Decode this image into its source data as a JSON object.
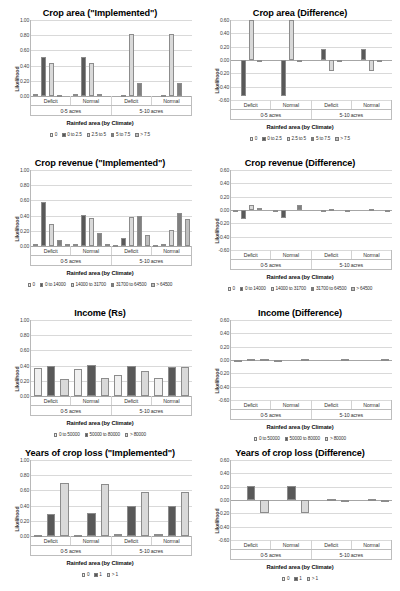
{
  "figure": {
    "axis_title_x": "Rainfed area (by Climate)",
    "axis_title_y": "Likelihood",
    "group_labels": [
      "Deficit",
      "Normal",
      "Deficit",
      "Normal"
    ],
    "band_labels": [
      "0-5 acres",
      "5-10 acres"
    ]
  },
  "palette": {
    "s1": "#f0f0f0",
    "s2": "#595959",
    "s3": "#d9d9d9",
    "s4": "#808080",
    "s5": "#bfbfbf"
  },
  "charts": [
    {
      "id": "crop-area-implemented",
      "title": "Crop area (\"Implemented\")",
      "yticks": [
        "1.00",
        "0.80",
        "0.60",
        "0.40",
        "0.20",
        "0.00"
      ],
      "chart_data": {
        "type": "bar",
        "title": "Crop area (\"Implemented\")",
        "xlabel": "Rainfed area (by Climate)",
        "ylabel": "Likelihood",
        "ylim": [
          0.0,
          1.0
        ],
        "grid": true,
        "legend_position": "bottom",
        "categories": [
          "Deficit (0-5 acres)",
          "Normal (0-5 acres)",
          "Deficit (5-10 acres)",
          "Normal (5-10 acres)"
        ],
        "series": [
          {
            "name": "0",
            "values": [
              0.02,
              0.02,
              0.0,
              0.0
            ]
          },
          {
            "name": "0 to 2.5",
            "values": [
              0.51,
              0.51,
              0.01,
              0.01
            ]
          },
          {
            "name": "2.5 to 5",
            "values": [
              0.43,
              0.43,
              0.82,
              0.82
            ]
          },
          {
            "name": "5 to 7.5",
            "values": [
              0.01,
              0.02,
              0.17,
              0.17
            ]
          },
          {
            "name": "> 7.5",
            "values": [
              0.0,
              0.0,
              0.0,
              0.0
            ]
          }
        ]
      }
    },
    {
      "id": "crop-area-difference",
      "title": "Crop area (Difference)",
      "yticks": [
        "0.60",
        "0.40",
        "0.20",
        "0.00",
        "-0.20",
        "-0.40",
        "-0.60"
      ],
      "chart_data": {
        "type": "bar",
        "title": "Crop area (Difference)",
        "xlabel": "Rainfed area (by Climate)",
        "ylabel": "Likelihood",
        "ylim": [
          -0.6,
          0.6
        ],
        "grid": true,
        "legend_position": "bottom",
        "categories": [
          "Deficit (0-5 acres)",
          "Normal (0-5 acres)",
          "Deficit (5-10 acres)",
          "Normal (5-10 acres)"
        ],
        "series": [
          {
            "name": "0",
            "values": [
              0.0,
              0.0,
              0.0,
              0.0
            ]
          },
          {
            "name": "0 to 2.5",
            "values": [
              -0.54,
              -0.54,
              0.17,
              0.17
            ]
          },
          {
            "name": "2.5 to 5",
            "values": [
              0.6,
              0.6,
              -0.16,
              -0.16
            ]
          },
          {
            "name": "5 to 7.5",
            "values": [
              -0.01,
              -0.01,
              -0.01,
              -0.01
            ]
          },
          {
            "name": "> 7.5",
            "values": [
              0.0,
              0.0,
              0.0,
              0.0
            ]
          }
        ]
      }
    },
    {
      "id": "crop-revenue-implemented",
      "title": "Crop revenue (\"Implemented\")",
      "yticks": [
        "1.00",
        "0.80",
        "0.60",
        "0.40",
        "0.20",
        "0.00"
      ],
      "chart_data": {
        "type": "bar",
        "title": "Crop revenue (\"Implemented\")",
        "xlabel": "Rainfed area (by Climate)",
        "ylabel": "Likelihood",
        "ylim": [
          0.0,
          1.0
        ],
        "grid": true,
        "legend_position": "bottom",
        "categories": [
          "Deficit (0-5 acres)",
          "Normal (0-5 acres)",
          "Deficit (5-10 acres)",
          "Normal (5-10 acres)"
        ],
        "series": [
          {
            "name": "0",
            "values": [
              0.02,
              0.03,
              0.01,
              0.01
            ]
          },
          {
            "name": "0 to 14000",
            "values": [
              0.58,
              0.41,
              0.1,
              0.03
            ]
          },
          {
            "name": "14000 to 31700",
            "values": [
              0.29,
              0.37,
              0.38,
              0.21
            ]
          },
          {
            "name": "31700 to 64500",
            "values": [
              0.08,
              0.17,
              0.39,
              0.43
            ]
          },
          {
            "name": "> 64500",
            "values": [
              0.02,
              0.03,
              0.15,
              0.36
            ]
          }
        ]
      }
    },
    {
      "id": "crop-revenue-difference",
      "title": "Crop revenue (Difference)",
      "yticks": [
        "0.60",
        "0.40",
        "0.20",
        "0.00",
        "-0.20",
        "-0.40",
        "-0.60"
      ],
      "chart_data": {
        "type": "bar",
        "title": "Crop revenue (Difference)",
        "xlabel": "Rainfed area (by Climate)",
        "ylabel": "Likelihood",
        "ylim": [
          -0.6,
          0.6
        ],
        "grid": true,
        "legend_position": "bottom",
        "categories": [
          "Deficit (0-5 acres)",
          "Normal (0-5 acres)",
          "Deficit (5-10 acres)",
          "Normal (5-10 acres)"
        ],
        "series": [
          {
            "name": "0",
            "values": [
              -0.01,
              -0.01,
              0.0,
              0.0
            ]
          },
          {
            "name": "0 to 14000",
            "values": [
              -0.13,
              -0.12,
              -0.01,
              0.0
            ]
          },
          {
            "name": "14000 to 31700",
            "values": [
              0.07,
              0.0,
              0.01,
              0.02
            ]
          },
          {
            "name": "31700 to 64500",
            "values": [
              0.03,
              0.07,
              0.0,
              0.0
            ]
          },
          {
            "name": "> 64500",
            "values": [
              0.0,
              0.0,
              -0.01,
              -0.01
            ]
          }
        ]
      }
    },
    {
      "id": "income-rs",
      "title": "Income (Rs)",
      "yticks": [
        "1.00",
        "0.80",
        "0.60",
        "0.40",
        "0.20",
        "0.00"
      ],
      "chart_data": {
        "type": "bar",
        "title": "Income (Rs)",
        "xlabel": "Rainfed area (by Climate)",
        "ylabel": "Likelihood",
        "ylim": [
          0.0,
          1.0
        ],
        "grid": true,
        "legend_position": "bottom",
        "categories": [
          "Deficit (0-5 acres)",
          "Normal (0-5 acres)",
          "Deficit (5-10 acres)",
          "Normal (5-10 acres)"
        ],
        "series": [
          {
            "name": "0 to 50000",
            "values": [
              0.37,
              0.35,
              0.28,
              0.24
            ]
          },
          {
            "name": "50000 to 80000",
            "values": [
              0.4,
              0.41,
              0.39,
              0.38
            ]
          },
          {
            "name": "> 80000",
            "values": [
              0.22,
              0.24,
              0.33,
              0.38
            ]
          }
        ]
      }
    },
    {
      "id": "income-difference",
      "title": "Income (Difference)",
      "yticks": [
        "0.60",
        "0.40",
        "0.20",
        "0.00",
        "-0.20",
        "-0.40",
        "-0.60"
      ],
      "chart_data": {
        "type": "bar",
        "title": "Income (Difference)",
        "xlabel": "Rainfed area (by Climate)",
        "ylabel": "Likelihood",
        "ylim": [
          -0.6,
          0.6
        ],
        "grid": true,
        "legend_position": "bottom",
        "categories": [
          "Deficit (0-5 acres)",
          "Normal (0-5 acres)",
          "Deficit (5-10 acres)",
          "Normal (5-10 acres)"
        ],
        "series": [
          {
            "name": "0 to 50000",
            "values": [
              -0.01,
              -0.01,
              0.0,
              0.0
            ]
          },
          {
            "name": "50000 to 80000",
            "values": [
              0.01,
              0.0,
              0.0,
              0.0
            ]
          },
          {
            "name": "> 80000",
            "values": [
              0.01,
              0.01,
              0.01,
              0.01
            ]
          }
        ]
      }
    },
    {
      "id": "years-crop-loss-implemented",
      "title": "Years of crop loss (\"Implemented\")",
      "yticks": [
        "1.00",
        "0.80",
        "0.60",
        "0.40",
        "0.20",
        "0.00"
      ],
      "chart_data": {
        "type": "bar",
        "title": "Years of crop loss (\"Implemented\")",
        "xlabel": "Rainfed area (by Climate)",
        "ylabel": "Likelihood",
        "ylim": [
          0.0,
          1.0
        ],
        "grid": true,
        "legend_position": "bottom",
        "categories": [
          "Deficit (0-5 acres)",
          "Normal (0-5 acres)",
          "Deficit (5-10 acres)",
          "Normal (5-10 acres)"
        ],
        "series": [
          {
            "name": "0",
            "values": [
              0.01,
              0.01,
              0.03,
              0.03
            ]
          },
          {
            "name": "1",
            "values": [
              0.29,
              0.3,
              0.39,
              0.39
            ]
          },
          {
            "name": "> 1",
            "values": [
              0.7,
              0.69,
              0.58,
              0.58
            ]
          }
        ]
      }
    },
    {
      "id": "years-crop-loss-difference",
      "title": "Years of crop loss (Difference)",
      "yticks": [
        "0.60",
        "0.40",
        "0.20",
        "0.00",
        "-0.20",
        "-0.40",
        "-0.60"
      ],
      "chart_data": {
        "type": "bar",
        "title": "Years of crop loss (Difference)",
        "xlabel": "Rainfed area (by Climate)",
        "ylabel": "Likelihood",
        "ylim": [
          -0.6,
          0.6
        ],
        "grid": true,
        "legend_position": "bottom",
        "categories": [
          "Deficit (0-5 acres)",
          "Normal (0-5 acres)",
          "Deficit (5-10 acres)",
          "Normal (5-10 acres)"
        ],
        "series": [
          {
            "name": "0",
            "values": [
              0.0,
              0.0,
              0.0,
              0.0
            ]
          },
          {
            "name": "1",
            "values": [
              0.21,
              0.21,
              0.01,
              0.01
            ]
          },
          {
            "name": "> 1",
            "values": [
              -0.2,
              -0.2,
              -0.01,
              -0.01
            ]
          }
        ]
      }
    }
  ]
}
